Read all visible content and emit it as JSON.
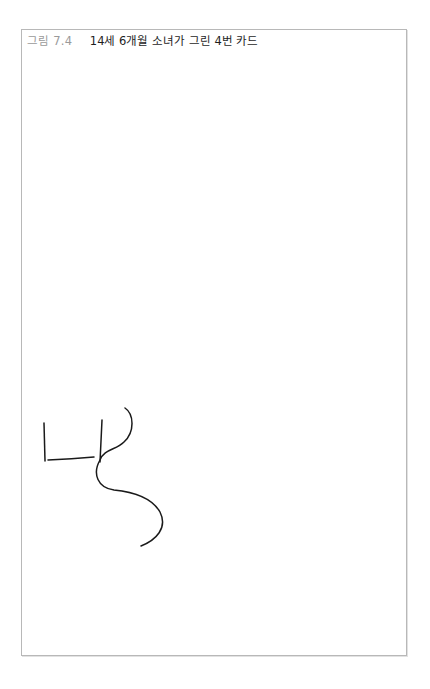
{
  "figure": {
    "label": "그림 7.4",
    "title": "14세 6개월 소녀가 그린 4번 카드",
    "border_color": "#b8b8b8",
    "stroke_color": "#1a1a1a"
  },
  "drawing": {
    "description": "Hand-drawn line sketch: a small open L/ㄴ-like shape with a vertical line on its right, crossed by a long S-shaped curve",
    "strokes": [
      {
        "name": "left-vertical",
        "d": "M44,423 L45,461"
      },
      {
        "name": "horizontal",
        "d": "M48,460 Q72,459 94,457"
      },
      {
        "name": "middle-vertical",
        "d": "M102,420 Q101,440 100,462"
      },
      {
        "name": "s-curve",
        "d": "M125,408 C134,414 135,432 124,442 C116,450 104,449 100,460 C92,474 98,488 114,490 C134,492 152,498 160,512 C168,528 156,540 141,546"
      }
    ]
  }
}
